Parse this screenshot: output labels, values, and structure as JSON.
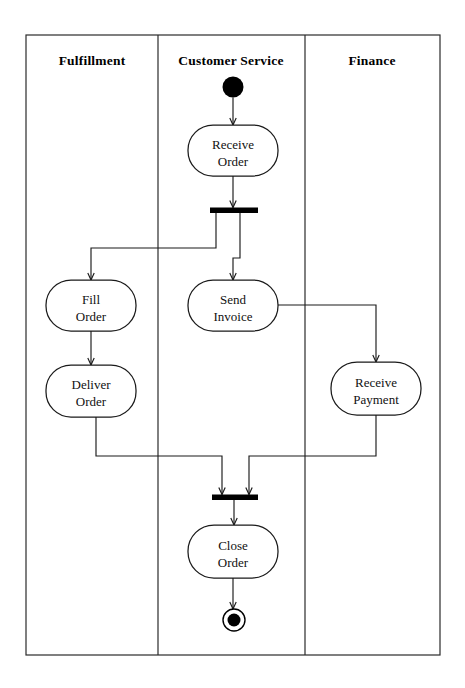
{
  "diagram": {
    "type": "uml-activity-swimlane",
    "frame": {
      "x": 26,
      "y": 35,
      "width": 414,
      "height": 620
    },
    "lanes": [
      {
        "id": "fulfillment",
        "label": "Fulfillment",
        "x": 26,
        "width": 132,
        "title_cx": 92,
        "title_cy": 65
      },
      {
        "id": "customer-service",
        "label": "Customer Service",
        "x": 158,
        "width": 147,
        "title_cx": 231,
        "title_cy": 65
      },
      {
        "id": "finance",
        "label": "Finance",
        "x": 305,
        "width": 135,
        "title_cx": 372,
        "title_cy": 65
      }
    ],
    "lane_dividers": [
      158,
      305
    ],
    "nodes": {
      "start": {
        "kind": "initial-node",
        "label": "",
        "cx": 233,
        "cy": 87,
        "r": 10.5
      },
      "receive_order": {
        "kind": "activity",
        "label_line1": "Receive",
        "label_line2": "Order",
        "x": 188,
        "y": 125,
        "width": 90,
        "height": 51,
        "cx": 233,
        "cy": 150.5
      },
      "fork": {
        "kind": "fork-bar",
        "x": 210,
        "y": 207.5,
        "width": 48,
        "height": 5.5
      },
      "fill_order": {
        "kind": "activity",
        "label_line1": "Fill",
        "label_line2": "Order",
        "x": 46,
        "y": 280,
        "width": 90,
        "height": 51,
        "cx": 91,
        "cy": 305.5
      },
      "send_invoice": {
        "kind": "activity",
        "label_line1": "Send",
        "label_line2": "Invoice",
        "x": 188,
        "y": 280,
        "width": 90,
        "height": 51,
        "cx": 233,
        "cy": 305.5
      },
      "deliver_order": {
        "kind": "activity",
        "label_line1": "Deliver",
        "label_line2": "Order",
        "x": 46,
        "y": 365,
        "width": 90,
        "height": 52,
        "cx": 91,
        "cy": 391
      },
      "receive_payment": {
        "kind": "activity",
        "label_line1": "Receive",
        "label_line2": "Payment",
        "x": 331,
        "y": 362,
        "width": 90,
        "height": 53,
        "cx": 376,
        "cy": 388.5
      },
      "join": {
        "kind": "join-bar",
        "x": 212,
        "y": 494.5,
        "width": 46,
        "height": 5.5
      },
      "close_order": {
        "kind": "activity",
        "label_line1": "Close",
        "label_line2": "Order",
        "x": 188,
        "y": 525,
        "width": 90,
        "height": 53,
        "cx": 233,
        "cy": 551.5
      },
      "end": {
        "kind": "final-node",
        "label": "",
        "cx": 234,
        "cy": 620,
        "outer_r": 11,
        "inner_r": 6.5
      }
    },
    "flows": [
      {
        "id": "start-to-receive-order",
        "from": "start",
        "to": "receive_order",
        "path": "M 233 97.5 L 233 125"
      },
      {
        "id": "receive-order-to-fork",
        "from": "receive_order",
        "to": "fork",
        "path": "M 233 176 L 233 207.5"
      },
      {
        "id": "fork-to-fill-order",
        "from": "fork",
        "to": "fill_order",
        "path": "M 216 213 L 216 248 L 91 248 L 91 280"
      },
      {
        "id": "fork-to-send-invoice",
        "from": "fork",
        "to": "send_invoice",
        "path": "M 240 213 L 240 258 L 233 258 L 233 280"
      },
      {
        "id": "fill-order-to-deliver-order",
        "from": "fill_order",
        "to": "deliver_order",
        "path": "M 91 331 L 91 365"
      },
      {
        "id": "send-invoice-to-receive-payment",
        "from": "send_invoice",
        "to": "receive_payment",
        "path": "M 278 305 L 376 305 L 376 362"
      },
      {
        "id": "deliver-order-to-join",
        "from": "deliver_order",
        "to": "join",
        "path": "M 96 417 L 96 456 L 222 456 L 222 494.5"
      },
      {
        "id": "receive-payment-to-join",
        "from": "receive_payment",
        "to": "join",
        "path": "M 376 415 L 376 456 L 249 456 L 249 494.5"
      },
      {
        "id": "join-to-close-order",
        "from": "join",
        "to": "close_order",
        "path": "M 234 500 L 234 525"
      },
      {
        "id": "close-order-to-end",
        "from": "close_order",
        "to": "end",
        "path": "M 233 578 L 233 609"
      }
    ],
    "colors": {
      "background": "#ffffff",
      "stroke": "#1a1a1a",
      "frame_stroke": "#2b2b2b",
      "node_fill": "#ffffff",
      "bar_fill": "#000000",
      "text": "#111111"
    }
  }
}
